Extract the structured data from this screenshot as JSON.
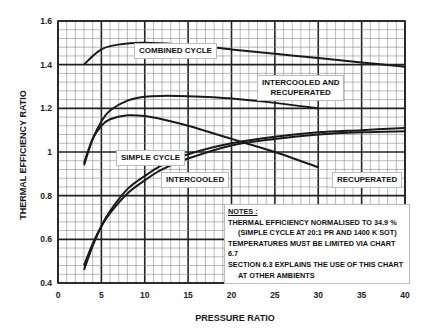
{
  "chart_data": {
    "type": "line",
    "title": "",
    "xlabel": "PRESSURE RATIO",
    "ylabel": "THERMAL EFFICIENCY RATIO",
    "xlim": [
      0,
      40
    ],
    "ylim": [
      0.4,
      1.6
    ],
    "x_ticks": [
      "0",
      "5",
      "10",
      "15",
      "20",
      "25",
      "30",
      "35",
      "40"
    ],
    "y_ticks": [
      "0.4",
      "0.6",
      "0.8",
      "1",
      "1.2",
      "1.4",
      "1.6"
    ],
    "grid": true,
    "series": [
      {
        "name": "COMBINED CYCLE",
        "x": [
          3,
          4,
          5,
          6,
          8,
          10,
          15,
          20,
          25,
          30,
          35,
          40
        ],
        "y": [
          1.4,
          1.44,
          1.47,
          1.485,
          1.497,
          1.5,
          1.49,
          1.47,
          1.45,
          1.43,
          1.41,
          1.39
        ]
      },
      {
        "name": "INTERCOOLED AND RECUPERATED",
        "x": [
          3,
          4,
          5,
          6,
          8,
          10,
          12,
          15,
          20,
          25,
          30
        ],
        "y": [
          0.94,
          1.06,
          1.14,
          1.19,
          1.235,
          1.253,
          1.257,
          1.255,
          1.245,
          1.225,
          1.2
        ]
      },
      {
        "name": "RECUPERATED",
        "x": [
          3,
          4,
          5,
          6,
          8,
          10,
          12,
          15,
          20,
          25,
          30
        ],
        "y": [
          0.95,
          1.06,
          1.12,
          1.15,
          1.168,
          1.165,
          1.15,
          1.12,
          1.06,
          1.0,
          0.93
        ]
      },
      {
        "name": "SIMPLE CYCLE",
        "x": [
          3,
          4,
          5,
          6,
          8,
          10,
          12,
          15,
          20,
          25,
          30,
          35,
          40
        ],
        "y": [
          0.46,
          0.57,
          0.66,
          0.73,
          0.83,
          0.89,
          0.94,
          0.99,
          1.04,
          1.07,
          1.09,
          1.1,
          1.11
        ]
      },
      {
        "name": "INTERCOOLED",
        "x": [
          3,
          4,
          5,
          6,
          8,
          10,
          12,
          15,
          20,
          25,
          30,
          35,
          40
        ],
        "y": [
          0.48,
          0.58,
          0.66,
          0.72,
          0.81,
          0.87,
          0.92,
          0.97,
          1.03,
          1.06,
          1.08,
          1.09,
          1.095
        ]
      }
    ],
    "annotations": [
      "NOTES :",
      "THERMAL EFFICIENCY NORMALISED TO 34.9 %",
      "(SIMPLE CYCLE AT 20:1 PR AND 1400 K SOT)",
      "TEMPERATURES MUST BE LIMITED VIA CHART 6.7",
      "SECTION 6.3 EXPLAINS THE USE OF THIS CHART",
      "AT OTHER AMBIENTS"
    ]
  },
  "labels": {
    "combined": "COMBINED CYCLE",
    "icr_line1": "INTERCOOLED AND",
    "icr_line2": "RECUPERATED",
    "simple": "SIMPLE CYCLE",
    "intercooled": "INTERCOOLED",
    "recuperated": "RECUPERATED"
  },
  "notes": {
    "heading": "NOTES :",
    "line1": "THERMAL EFFICIENCY NORMALISED TO 34.9 %",
    "line2": "(SIMPLE CYCLE AT 20:1 PR AND 1400 K SOT)",
    "line3": "TEMPERATURES MUST BE LIMITED VIA CHART 6.7",
    "line4": "SECTION 6.3 EXPLAINS THE USE OF THIS CHART",
    "line5": "AT OTHER AMBIENTS"
  },
  "axes": {
    "xlabel": "PRESSURE RATIO",
    "ylabel": "THERMAL EFFICIENCY RATIO"
  },
  "colors": {
    "grid_minor": "#8a8a8a",
    "grid_major": "#222222",
    "curve": "#1a1a1a"
  }
}
